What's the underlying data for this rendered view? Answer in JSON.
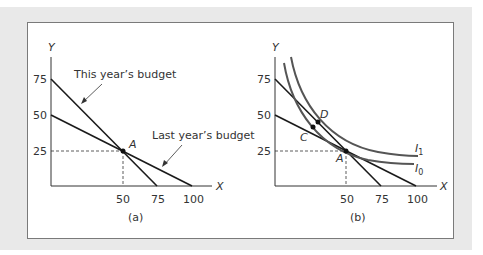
{
  "figure": {
    "panel_a": {
      "caption": "(a)",
      "caption_letter": "a",
      "y_axis_label": "Y",
      "x_axis_label": "X",
      "y_ticks": [
        "75",
        "50",
        "25"
      ],
      "x_ticks": [
        "50",
        "75",
        "100"
      ],
      "this_year_label": "This year’s budget",
      "last_year_label": "Last year’s budget",
      "point_A": "A"
    },
    "panel_b": {
      "caption": "(b)",
      "caption_letter": "b",
      "y_axis_label": "Y",
      "x_axis_label": "X",
      "y_ticks": [
        "75",
        "50",
        "25"
      ],
      "x_ticks": [
        "50",
        "75",
        "100"
      ],
      "point_A": "A",
      "point_C": "C",
      "point_D": "D",
      "curve_I1": "I",
      "curve_I1_sub": "1",
      "curve_I0": "I",
      "curve_I0_sub": "0"
    },
    "colors": {
      "panel_bg": "#e9e9e9",
      "frame_border": "#7a7a7a",
      "line": "#1a1a1a",
      "curve": "#555555"
    }
  }
}
